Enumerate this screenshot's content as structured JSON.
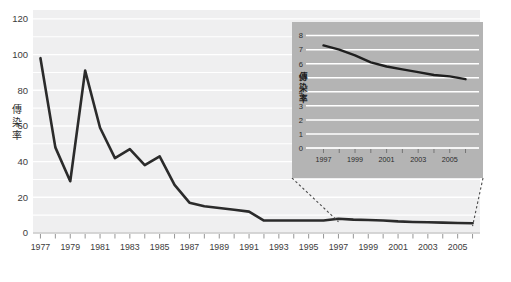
{
  "figure": {
    "background_color": "#ffffff",
    "plot_background_color": "#efeff0",
    "gridline_color": "#ffffff",
    "line_color": "#2b2b2b",
    "inset_background_color": "#b4b4b4",
    "inset_gridline_color": "#ffffff",
    "tick_color": "#8a8a8a"
  },
  "chart_data": [
    {
      "id": "main",
      "type": "line",
      "title": "",
      "xlabel": "",
      "ylabel": "傳染率",
      "xlim": [
        1976.5,
        2006.5
      ],
      "ylim": [
        0,
        125
      ],
      "yticks": [
        0,
        20,
        40,
        60,
        80,
        100,
        120
      ],
      "ytick_labels": [
        "0",
        "20",
        "40",
        "60",
        "80",
        "100",
        "120"
      ],
      "grid": true,
      "grid_interval": 10,
      "legend": "none",
      "xtick_labels": [
        "1977",
        "1979",
        "1981",
        "1983",
        "1985",
        "1987",
        "1989",
        "1991",
        "1993",
        "1995",
        "1997",
        "1999",
        "2001",
        "2003",
        "2005"
      ],
      "xtick_all_years": [
        1977,
        1978,
        1979,
        1980,
        1981,
        1982,
        1983,
        1984,
        1985,
        1986,
        1987,
        1988,
        1989,
        1990,
        1991,
        1992,
        1993,
        1994,
        1995,
        1996,
        1997,
        1998,
        1999,
        2000,
        2001,
        2002,
        2003,
        2004,
        2005,
        2006
      ],
      "x": [
        1977,
        1978,
        1979,
        1980,
        1981,
        1982,
        1983,
        1984,
        1985,
        1986,
        1987,
        1988,
        1989,
        1990,
        1991,
        1992,
        1993,
        1994,
        1995,
        1996,
        1997,
        1998,
        1999,
        2000,
        2001,
        2002,
        2003,
        2004,
        2005,
        2006
      ],
      "values": [
        98,
        48,
        29,
        91,
        59,
        42,
        47,
        38,
        43,
        27,
        17,
        15,
        14,
        13,
        12,
        7,
        7,
        7,
        7,
        7,
        8,
        7.5,
        7.3,
        7,
        6.5,
        6.2,
        6,
        5.8,
        5.6,
        5.5
      ]
    },
    {
      "id": "inset",
      "type": "line",
      "title": "",
      "xlabel": "",
      "ylabel": "傳染率",
      "xlim": [
        1996.4,
        2006.6
      ],
      "ylim": [
        0,
        8.4
      ],
      "yticks": [
        0,
        1,
        2,
        3,
        4,
        5,
        6,
        7,
        8
      ],
      "ytick_labels": [
        "0",
        "1",
        "2",
        "3",
        "4",
        "5",
        "6",
        "7",
        "8"
      ],
      "grid": true,
      "grid_interval": 1,
      "legend": "none",
      "xtick_labels": [
        "1997",
        "1999",
        "2001",
        "2003",
        "2005"
      ],
      "xtick_all_years": [
        1997,
        1998,
        1999,
        2000,
        2001,
        2002,
        2003,
        2004,
        2005,
        2006
      ],
      "x": [
        1997,
        1998,
        1999,
        2000,
        2001,
        2002,
        2003,
        2004,
        2005,
        2006
      ],
      "values": [
        7.3,
        7.0,
        6.6,
        6.1,
        5.8,
        5.6,
        5.4,
        5.2,
        5.1,
        4.9
      ]
    }
  ]
}
